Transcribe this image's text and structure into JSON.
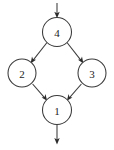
{
  "figure": {
    "type": "directed-graph",
    "title": "",
    "background_color": "#ffffff",
    "stroke_color": "#3a3a3a",
    "label_color": "#1c1c1c",
    "arrowhead_color": "#2b2b2b",
    "width": 114,
    "height": 150
  },
  "nodes": [
    {
      "id": "4",
      "label": "4",
      "cx": 57,
      "cy": 32,
      "r": 14.5,
      "role": "top"
    },
    {
      "id": "2",
      "label": "2",
      "cx": 22,
      "cy": 73,
      "r": 14.0,
      "role": "left"
    },
    {
      "id": "3",
      "label": "3",
      "cx": 92,
      "cy": 73,
      "r": 14.0,
      "role": "right"
    },
    {
      "id": "1",
      "label": "1",
      "cx": 57,
      "cy": 110,
      "r": 14.5,
      "role": "bottom"
    }
  ],
  "edges": [
    {
      "from": "4",
      "to": "2",
      "directed": true,
      "label": ""
    },
    {
      "from": "4",
      "to": "3",
      "directed": true,
      "label": ""
    },
    {
      "from": "2",
      "to": "1",
      "directed": true,
      "label": ""
    },
    {
      "from": "3",
      "to": "1",
      "directed": true,
      "label": ""
    }
  ],
  "terminals": [
    {
      "kind": "entry-arrow",
      "target": "4",
      "from_x": 57,
      "from_y": 3,
      "to_x": 57,
      "to_y": 17,
      "label": ""
    },
    {
      "kind": "exit-arrow",
      "source": "1",
      "from_x": 57,
      "from_y": 125,
      "to_x": 57,
      "to_y": 144,
      "label": ""
    }
  ]
}
